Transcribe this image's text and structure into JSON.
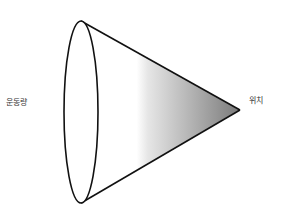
{
  "diagram": {
    "title": "",
    "labels": {
      "left": "운동량",
      "right": "위치"
    },
    "shape": "cone",
    "colors": {
      "stroke": "#111111",
      "gradient_start": "#ffffff",
      "gradient_end": "#7a7a7a",
      "background": "#ffffff"
    }
  }
}
